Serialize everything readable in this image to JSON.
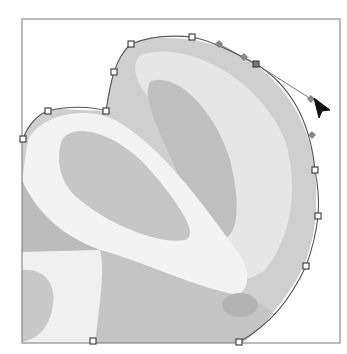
{
  "canvas": {
    "width": 347,
    "height": 354,
    "frame": {
      "x": 22,
      "y": 19,
      "width": 318,
      "height": 324,
      "stroke": "#777777"
    },
    "background": "#ffffff"
  },
  "image": {
    "subject": "grayscale-citrus-fruit-halves",
    "colors": {
      "light": "#f2f2f2",
      "mid": "#cfcfcf",
      "dark": "#b5b5b5",
      "rind": "#e8e8e8"
    }
  },
  "path": {
    "tool": "pen-tool-path",
    "anchors": [
      {
        "x": 23,
        "y": 139
      },
      {
        "x": 48,
        "y": 111
      },
      {
        "x": 106,
        "y": 111
      },
      {
        "x": 114,
        "y": 72
      },
      {
        "x": 131,
        "y": 44
      },
      {
        "x": 192,
        "y": 37
      },
      {
        "x": 256,
        "y": 64,
        "selected": true
      },
      {
        "x": 315,
        "y": 170
      },
      {
        "x": 318,
        "y": 216
      },
      {
        "x": 306,
        "y": 266
      },
      {
        "x": 239,
        "y": 342
      },
      {
        "x": 93,
        "y": 341
      }
    ],
    "direction_points": [
      {
        "x": 219,
        "y": 44
      },
      {
        "x": 244,
        "y": 57
      },
      {
        "x": 312,
        "y": 135
      }
    ],
    "handle": {
      "from": {
        "x": 256,
        "y": 64
      },
      "to": {
        "x": 311,
        "y": 99
      }
    }
  },
  "cursor": {
    "type": "direct-selection-arrow",
    "x": 314,
    "y": 98
  }
}
